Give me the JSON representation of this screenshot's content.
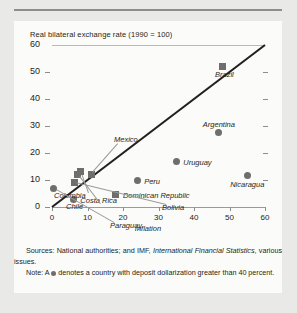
{
  "top_cut_text": "",
  "chart_data": {
    "type": "scatter",
    "title": "",
    "ylabel": "Real bilateral exchange rate (1990 = 100)",
    "xlabel": "Inflation",
    "xlim": [
      0,
      60
    ],
    "ylim": [
      0,
      60
    ],
    "xticks": [
      0,
      10,
      20,
      30,
      40,
      50,
      60
    ],
    "yticks": [
      0,
      10,
      20,
      30,
      40,
      50,
      60
    ],
    "grid": false,
    "legend": "none",
    "reference_line": {
      "label": "45-degree line",
      "from": [
        0,
        0
      ],
      "to": [
        60,
        60
      ]
    },
    "marker_semantics": {
      "circle": "deposit dollarization greater than 40 percent",
      "square": "deposit dollarization 40 percent or less"
    },
    "points": [
      {
        "name": "Brazil",
        "x": 48.0,
        "y": 52.0,
        "marker": "square",
        "label_dx": 2,
        "label_dy": 9,
        "label_anchor": "middle"
      },
      {
        "name": "Argentina",
        "x": 47.0,
        "y": 27.5,
        "marker": "circle",
        "label_dx": 0,
        "label_dy": -7,
        "label_anchor": "middle"
      },
      {
        "name": "Uruguay",
        "x": 35.0,
        "y": 17.0,
        "marker": "circle",
        "label_dx": 7,
        "label_dy": 3,
        "label_anchor": "start"
      },
      {
        "name": "Nicaragua",
        "x": 55.0,
        "y": 11.5,
        "marker": "circle",
        "label_dx": 0,
        "label_dy": 10,
        "label_anchor": "middle"
      },
      {
        "name": "Peru",
        "x": 24.0,
        "y": 10.0,
        "marker": "circle",
        "label_dx": 7,
        "label_dy": 3,
        "label_anchor": "start"
      },
      {
        "name": "Dominican Republic",
        "x": 18.0,
        "y": 4.8,
        "marker": "square",
        "label_dx": 7,
        "label_dy": 3,
        "label_anchor": "start"
      },
      {
        "name": "Mexico",
        "x": 11.0,
        "y": 12.0,
        "marker": "square",
        "label_dx": 0,
        "label_dy": 0,
        "label_anchor": "leader"
      },
      {
        "name": "Colombia",
        "x": 8.0,
        "y": 13.0,
        "marker": "square",
        "label_dx": 0,
        "label_dy": 0,
        "label_anchor": "leader"
      },
      {
        "name": "Chile",
        "x": 7.2,
        "y": 12.0,
        "marker": "square",
        "label_dx": 0,
        "label_dy": 0,
        "label_anchor": "leader"
      },
      {
        "name": "Bolivia",
        "x": 6.2,
        "y": 9.0,
        "marker": "square",
        "label_dx": 0,
        "label_dy": 0,
        "label_anchor": "leader"
      },
      {
        "name": "Paraguay",
        "x": 0.5,
        "y": 6.8,
        "marker": "circle",
        "label_dx": 0,
        "label_dy": 0,
        "label_anchor": "leader"
      },
      {
        "name": "Costa Rica",
        "x": 6.0,
        "y": 2.8,
        "marker": "circle",
        "label_dx": 7,
        "label_dy": 3,
        "label_anchor": "start"
      }
    ],
    "leader_labels": [
      {
        "name": "Mexico",
        "text": "Mexico",
        "label_x": 62,
        "label_y": 90
      },
      {
        "name": "Colombia",
        "text": "Colombia",
        "label_x": 2,
        "label_y": 146
      },
      {
        "name": "Chile",
        "text": "Chile",
        "label_x": 14,
        "label_y": 157
      },
      {
        "name": "Bolivia",
        "text": "Bolivia",
        "label_x": 110,
        "label_y": 158
      },
      {
        "name": "Paraguay",
        "text": "Paraguay",
        "label_x": 58,
        "label_y": 176
      }
    ]
  },
  "notes": {
    "sources_prefix": "Sources: National authorities; and IMF, ",
    "sources_italic": "International Financial Statistics",
    "sources_suffix": ", various issues.",
    "note_prefix": "Note: A ",
    "note_suffix": " denotes a country with deposit dollarization greater than 40 percent."
  }
}
